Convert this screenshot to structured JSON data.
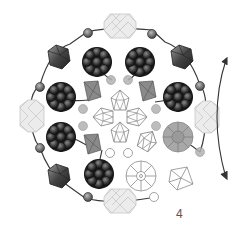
{
  "diagram": {
    "type": "beading-pattern",
    "step_number": "4",
    "colors": {
      "thread": "#3a3a3a",
      "dark_bead": "#1e1e1e",
      "dark_bead_ball": "#555555",
      "bicone_dark": "#5a5a5a",
      "bicone_mid": "#8a8a8a",
      "round_mid": "#9a9a9a",
      "faceted_light": "#e4e4e4",
      "outline": "#8c8c8c",
      "rivoli_gray": "#a6a6a6"
    },
    "elements": {
      "dark_clusters": 8,
      "corner_bicones": 4,
      "faceted_rondelles": 4,
      "inner_bicones": 4,
      "center_outline_crystals": 5,
      "arrow": "curved-double-arrow"
    }
  }
}
